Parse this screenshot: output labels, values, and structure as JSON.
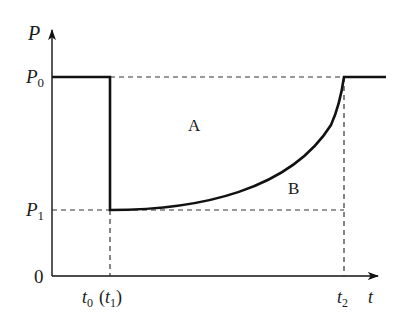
{
  "diagram": {
    "title": "",
    "y_axis": {
      "label": "P"
    },
    "x_axis": {
      "label": "t"
    },
    "origin_label": "0",
    "y_ticks": [
      {
        "main": "P",
        "sub": "0"
      },
      {
        "main": "P",
        "sub": "1"
      }
    ],
    "x_ticks": [
      {
        "main": "t",
        "sub": "0",
        "suffix_main": "t",
        "suffix_sub": "1"
      },
      {
        "main": "t",
        "sub": "2"
      }
    ],
    "regions": [
      {
        "label": "A"
      },
      {
        "label": "B"
      }
    ],
    "colors": {
      "line": "#111111",
      "dash": "#333333"
    }
  }
}
